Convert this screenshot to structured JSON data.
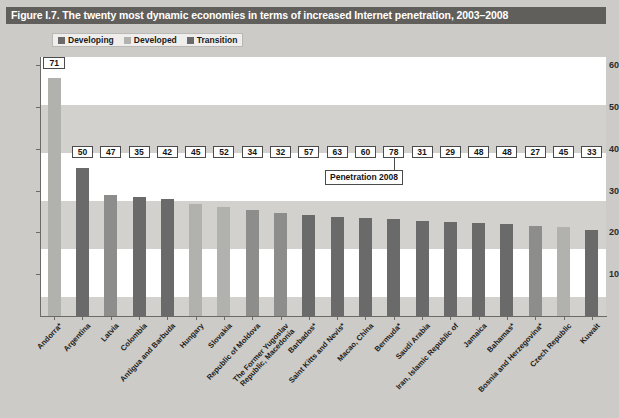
{
  "figure": {
    "title": "Figure I.7. The twenty most dynamic economies in terms of increased Internet penetration, 2003–2008"
  },
  "legend": {
    "items": [
      {
        "label": "Developing",
        "color": "#6a6a6a",
        "key": "developing"
      },
      {
        "label": "Developed",
        "color": "#b1b1ae",
        "key": "developed"
      },
      {
        "label": "Transition",
        "color": "#8d8d8b",
        "key": "transition"
      }
    ]
  },
  "annotation": {
    "label": "Penetration 2008"
  },
  "chart_data": {
    "type": "bar",
    "title": "Figure I.7. The twenty most dynamic economies in terms of increased Internet penetration, 2003–2008",
    "xlabel": "",
    "ylabel": "",
    "ylim": [
      0,
      62
    ],
    "yticks": [
      10,
      20,
      30,
      40,
      50,
      60
    ],
    "grid": false,
    "legend_position": "top-left",
    "value_label_name": "Penetration 2008",
    "categories": [
      "Andorra*",
      "Argentina",
      "Latvia",
      "Colombia",
      "Antigua and Barbuda",
      "Hungary",
      "Slovakia",
      "Republic of Moldova",
      "The Former Yugoslav\nRepublic, Macedonia",
      "Barbados*",
      "Saint Kitts and Nevis*",
      "Macao, China",
      "Bermuda*",
      "Saudi Arabia",
      "Iran, Islamic Republic of",
      "Jamaica",
      "Bahamas*",
      "Bosnia and Herzegovina*",
      "Czech Republic",
      "Kuwait"
    ],
    "series": [
      {
        "name": "Increase in Internet penetration 2003-2008",
        "values": [
          57.0,
          35.4,
          29.0,
          28.6,
          28.1,
          26.8,
          26.1,
          25.4,
          24.6,
          24.2,
          23.8,
          23.4,
          23.2,
          22.7,
          22.5,
          22.2,
          22.1,
          21.6,
          21.2,
          20.6
        ]
      }
    ],
    "group_of_category": [
      "developed",
      "developing",
      "transition",
      "developing",
      "developing",
      "developed",
      "developed",
      "transition",
      "transition",
      "developing",
      "developing",
      "developing",
      "developing",
      "developing",
      "developing",
      "developing",
      "developing",
      "transition",
      "developed",
      "developing"
    ],
    "value_labels": [
      71,
      50,
      47,
      35,
      42,
      45,
      52,
      34,
      32,
      57,
      63,
      60,
      78,
      31,
      29,
      48,
      48,
      27,
      45,
      33
    ]
  }
}
